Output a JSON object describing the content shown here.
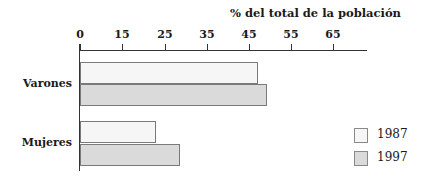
{
  "chart_data": {
    "type": "bar",
    "orientation": "horizontal",
    "title": "% del total de la población",
    "xlabel": "% del total de la población",
    "ylabel": "",
    "x_ticks": [
      "0",
      "15",
      "25",
      "35",
      "45",
      "55",
      "65"
    ],
    "categories": [
      "Varones",
      "Mujeres"
    ],
    "series": [
      {
        "name": "1987",
        "values": [
          47,
          23
        ],
        "color": "#f6f6f6"
      },
      {
        "name": "1997",
        "values": [
          49.5,
          28.5
        ],
        "color": "#dadada"
      }
    ],
    "legend_position": "right-bottom",
    "grid": false
  },
  "chart": {
    "title": "% del total de la población",
    "ticks": [
      {
        "label": "0",
        "x": 80
      },
      {
        "label": "15",
        "x": 122
      },
      {
        "label": "25",
        "x": 165
      },
      {
        "label": "35",
        "x": 207
      },
      {
        "label": "45",
        "x": 249
      },
      {
        "label": "55",
        "x": 291
      },
      {
        "label": "65",
        "x": 333
      }
    ],
    "categories": [
      {
        "label": "Varones",
        "y": 77,
        "bars": [
          {
            "top": 62,
            "end": 258
          },
          {
            "top": 84,
            "end": 267
          }
        ]
      },
      {
        "label": "Mujeres",
        "y": 136,
        "bars": [
          {
            "top": 121,
            "end": 156
          },
          {
            "top": 144,
            "end": 180
          }
        ]
      }
    ],
    "legend": [
      {
        "label": "1987",
        "y": 128
      },
      {
        "label": "1997",
        "y": 151
      }
    ]
  }
}
